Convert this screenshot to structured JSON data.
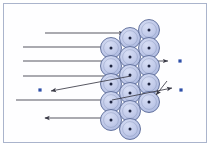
{
  "figure": {
    "title": "",
    "background_color": "#fefeff",
    "frame_color": "#aab4cc",
    "atom_fill": "#b9c4e8",
    "atom_fill_light": "#ccd5f0",
    "atom_stroke": "#5a6a96",
    "atom_center_color": "#1d2440",
    "ray_color": "#3a3a46",
    "particle_color": "#2e4fa8"
  },
  "lattice": {
    "label": "atom-lattice",
    "radius": 10.5,
    "center_dot_radius": 1.5,
    "columns": [
      {
        "name": "column-1",
        "cx": 111,
        "atoms": [
          {
            "cy": 48
          },
          {
            "cy": 66
          },
          {
            "cy": 84
          },
          {
            "cy": 102
          },
          {
            "cy": 120
          }
        ]
      },
      {
        "name": "column-2",
        "cx": 130,
        "atoms": [
          {
            "cy": 38
          },
          {
            "cy": 57
          },
          {
            "cy": 75
          },
          {
            "cy": 93
          },
          {
            "cy": 111
          },
          {
            "cy": 129
          }
        ]
      },
      {
        "name": "column-3",
        "cx": 149,
        "atoms": [
          {
            "cy": 30
          },
          {
            "cy": 48
          },
          {
            "cy": 66
          },
          {
            "cy": 84
          },
          {
            "cy": 102
          }
        ]
      }
    ]
  },
  "incident_rays": [
    {
      "name": "incident-ray-1",
      "x1": 45,
      "y1": 33,
      "x2": 124,
      "y2": 33,
      "arrow": "end"
    },
    {
      "name": "incident-ray-2",
      "x1": 23,
      "y1": 47,
      "x2": 105,
      "y2": 47,
      "arrow": "none"
    },
    {
      "name": "incident-ray-3",
      "x1": 23,
      "y1": 61,
      "x2": 168,
      "y2": 61,
      "arrow": "end"
    },
    {
      "name": "incident-ray-4",
      "x1": 23,
      "y1": 76,
      "x2": 131,
      "y2": 76,
      "arrow": "none"
    },
    {
      "name": "incident-ray-5",
      "x1": 16,
      "y1": 100,
      "x2": 112,
      "y2": 100,
      "arrow": "none"
    },
    {
      "name": "incident-ray-6",
      "x1": 45,
      "y1": 118,
      "x2": 101,
      "y2": 118,
      "arrow": "start"
    }
  ],
  "scattered_rays": [
    {
      "name": "scattered-ray-back-left",
      "x1": 131,
      "y1": 76,
      "x2": 51,
      "y2": 91,
      "arrow": "end"
    },
    {
      "name": "scattered-ray-forward-right-upper",
      "x1": 112,
      "y1": 100,
      "x2": 172,
      "y2": 88,
      "arrow": "end"
    },
    {
      "name": "scattered-ray-forward-right-lower",
      "x1": 167,
      "y1": 81,
      "x2": 156,
      "y2": 95,
      "arrow": "end"
    }
  ],
  "scattered_particles": [
    {
      "name": "particle-right-upper",
      "cx": 180,
      "cy": 61,
      "size": 3.2
    },
    {
      "name": "particle-right-lower",
      "cx": 181,
      "cy": 90,
      "size": 3.2
    },
    {
      "name": "particle-left",
      "cx": 40,
      "cy": 90,
      "size": 3.2
    }
  ]
}
